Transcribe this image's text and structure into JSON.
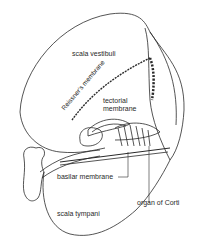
{
  "figure": {
    "type": "anatomical line drawing",
    "line_color": "#2a2a2a",
    "background": "#ffffff"
  },
  "labels": {
    "scala_vestibuli": "scala vestibuli",
    "reissners_membrane": "Reissner's membrane",
    "tectorial_line1": "tectorial",
    "tectorial_line2": "membrane",
    "basilar_membrane": "basilar membrane",
    "organ_of_corti": "organ of Corti",
    "scala_tympani": "scala tympani"
  }
}
